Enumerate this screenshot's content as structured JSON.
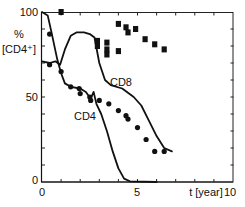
{
  "chart_data": {
    "type": "scatter",
    "title": "",
    "xlabel": "t [year]",
    "ylabel_line1": "%",
    "ylabel_line2": "[CD4⁺]",
    "xlim": [
      0,
      10
    ],
    "ylim": [
      0,
      100
    ],
    "x_ticks": [
      0,
      5,
      10
    ],
    "x_tick_labels": [
      "0",
      "5",
      "10"
    ],
    "y_ticks": [
      0,
      50,
      100
    ],
    "y_tick_labels": [
      "0",
      "50",
      "100"
    ],
    "grid": false,
    "legend": "none",
    "annotations": [
      {
        "text": "CD8",
        "x": 4.2,
        "y": 57
      },
      {
        "text": "CD4",
        "x": 2.9,
        "y": 37
      }
    ],
    "series": [
      {
        "name": "CD4 data (dots)",
        "marker": "circle",
        "points": [
          [
            0.4,
            87
          ],
          [
            0.4,
            69
          ],
          [
            1.0,
            65
          ],
          [
            1.5,
            56
          ],
          [
            1.95,
            55
          ],
          [
            2.0,
            52
          ],
          [
            2.5,
            50
          ],
          [
            2.55,
            48
          ],
          [
            3.0,
            48
          ],
          [
            3.5,
            46
          ],
          [
            4.0,
            42
          ],
          [
            4.4,
            39
          ],
          [
            4.5,
            37
          ],
          [
            5.0,
            32
          ],
          [
            5.45,
            25
          ],
          [
            5.9,
            18
          ],
          [
            6.4,
            18
          ]
        ]
      },
      {
        "name": "CD8 data (squares)",
        "marker": "square",
        "points": [
          [
            1.0,
            100
          ],
          [
            2.9,
            83
          ],
          [
            2.9,
            80
          ],
          [
            3.4,
            82
          ],
          [
            3.4,
            78
          ],
          [
            3.4,
            75
          ],
          [
            4.0,
            93
          ],
          [
            4.0,
            77
          ],
          [
            4.4,
            91
          ],
          [
            4.5,
            88
          ],
          [
            4.9,
            90
          ],
          [
            5.4,
            84
          ],
          [
            5.9,
            81
          ],
          [
            6.4,
            78
          ]
        ]
      },
      {
        "name": "CD4 model curve",
        "type": "line",
        "points": [
          [
            0.0,
            100
          ],
          [
            0.3,
            98
          ],
          [
            0.5,
            88
          ],
          [
            0.8,
            72
          ],
          [
            1.0,
            64
          ],
          [
            1.2,
            58
          ],
          [
            1.5,
            56
          ],
          [
            2.0,
            55
          ],
          [
            2.3,
            53
          ],
          [
            2.55,
            49
          ],
          [
            2.7,
            53
          ],
          [
            2.85,
            46
          ],
          [
            3.1,
            40
          ],
          [
            3.4,
            30
          ],
          [
            3.7,
            18
          ],
          [
            4.0,
            8
          ],
          [
            4.3,
            2
          ],
          [
            4.6,
            0.4
          ],
          [
            6.0,
            0
          ]
        ]
      },
      {
        "name": "CD8 model curve",
        "type": "line",
        "points": [
          [
            0.0,
            71
          ],
          [
            0.4,
            70
          ],
          [
            0.7,
            71
          ],
          [
            0.95,
            69
          ],
          [
            1.2,
            78
          ],
          [
            1.5,
            86
          ],
          [
            1.8,
            88
          ],
          [
            2.2,
            88
          ],
          [
            2.5,
            87
          ],
          [
            2.75,
            85
          ],
          [
            3.0,
            70
          ],
          [
            3.3,
            60
          ],
          [
            3.6,
            57
          ],
          [
            4.2,
            55
          ],
          [
            4.8,
            50
          ],
          [
            5.2,
            45
          ],
          [
            5.6,
            36
          ],
          [
            6.0,
            27
          ],
          [
            6.4,
            20
          ],
          [
            6.8,
            18
          ]
        ]
      }
    ]
  },
  "colors": {
    "ink": "#111111",
    "background": "#ffffff"
  }
}
